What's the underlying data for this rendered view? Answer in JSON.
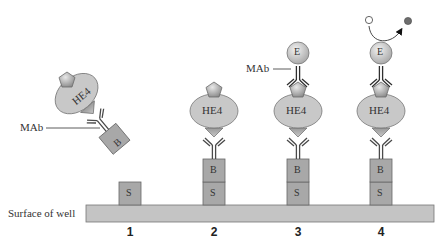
{
  "diagram": {
    "surface_label": "Surface of well",
    "steps": [
      {
        "number": "1",
        "components": [
          "S"
        ]
      },
      {
        "number": "2",
        "components": [
          "S",
          "B",
          "MAb",
          "HE4"
        ]
      },
      {
        "number": "3",
        "components": [
          "S",
          "B",
          "MAb",
          "HE4",
          "MAb",
          "E"
        ]
      },
      {
        "number": "4",
        "components": [
          "S",
          "B",
          "MAb",
          "HE4",
          "MAb",
          "E",
          "substrate",
          "product"
        ]
      }
    ],
    "floating_complex": {
      "antigen": "HE4",
      "antibody_label": "MAb",
      "tag": "B"
    },
    "labels": {
      "s": "S",
      "b": "B",
      "he4": "HE4",
      "e": "E",
      "mab_left": "MAb",
      "mab_step3": "MAb"
    },
    "colors": {
      "box_fill": "#a8a8a8",
      "surface_fill": "#c4c4c4",
      "ellipse_fill": "#c8c8c8",
      "stroke": "#666666",
      "antibody": "#4a4a4a",
      "product_dot": "#6e6e6e"
    }
  }
}
